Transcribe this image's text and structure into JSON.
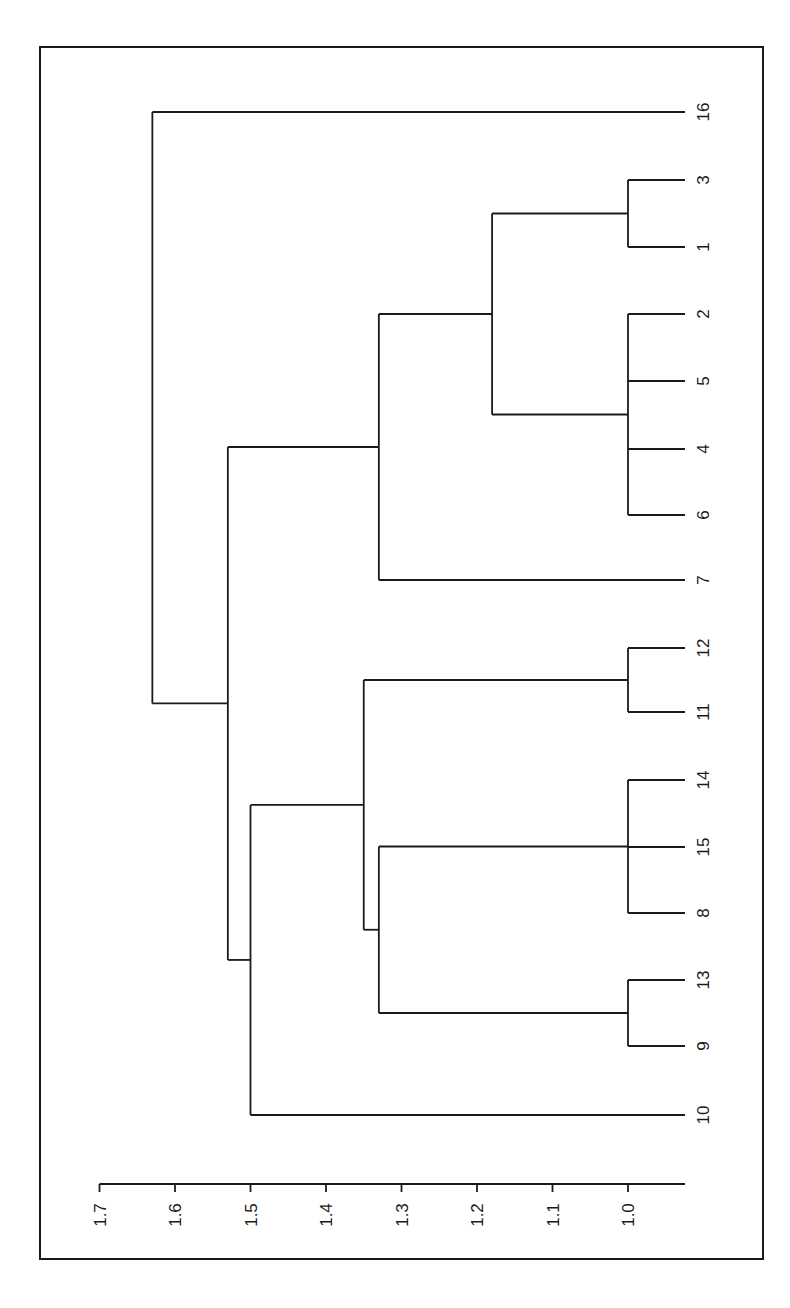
{
  "chart_data": {
    "type": "dendrogram",
    "orientation": "rotated-90 (leaves on right, height axis along bottom, labels rotated)",
    "title": "",
    "xlabel": "",
    "ylabel": "",
    "axis": {
      "range": [
        0.95,
        1.7
      ],
      "ticks": [
        1.7,
        1.6,
        1.5,
        1.4,
        1.3,
        1.2,
        1.1,
        1.0
      ],
      "tick_labels": [
        "1.7",
        "1.6",
        "1.5",
        "1.4",
        "1.3",
        "1.2",
        "1.1",
        "1.0"
      ]
    },
    "leaf_order": [
      "16",
      "3",
      "1",
      "2",
      "5",
      "4",
      "6",
      "7",
      "12",
      "11",
      "14",
      "15",
      "8",
      "13",
      "9",
      "10"
    ],
    "leaf_height": 0.93,
    "merges": [
      {
        "id": "m1",
        "members": [
          "3",
          "1"
        ],
        "height": 1.0
      },
      {
        "id": "m2",
        "members": [
          "2",
          "5",
          "4",
          "6"
        ],
        "height": 1.0
      },
      {
        "id": "m3",
        "members": [
          "12",
          "11"
        ],
        "height": 1.0
      },
      {
        "id": "m4",
        "members": [
          "14",
          "15",
          "8"
        ],
        "height": 1.0
      },
      {
        "id": "m5",
        "members": [
          "13",
          "9"
        ],
        "height": 1.0
      },
      {
        "id": "m6",
        "members": [
          "m1",
          "m2"
        ],
        "height": 1.18
      },
      {
        "id": "m7",
        "members": [
          "m6",
          "7"
        ],
        "height": 1.33
      },
      {
        "id": "m8",
        "members": [
          "m4",
          "m5"
        ],
        "height": 1.33
      },
      {
        "id": "m9",
        "members": [
          "m3",
          "m8"
        ],
        "height": 1.35
      },
      {
        "id": "m10",
        "members": [
          "m9",
          "10"
        ],
        "height": 1.5
      },
      {
        "id": "m11",
        "members": [
          "m7",
          "m10"
        ],
        "height": 1.53
      },
      {
        "id": "m12",
        "members": [
          "16",
          "m11"
        ],
        "height": 1.63
      }
    ],
    "grid": false,
    "legend": null
  },
  "layout": {
    "frame": {
      "x": 40,
      "y": 47,
      "w": 723,
      "h": 1212
    },
    "axis_y": 1184,
    "axis_x_end": 685,
    "tick_len": 8,
    "px_per_unit": 755,
    "x_at_1_0": 628,
    "leaf_tip_x": 685,
    "label_x": 703,
    "leaf_y": {
      "16": 112,
      "3": 180,
      "1": 247,
      "2": 314,
      "5": 381,
      "4": 449,
      "6": 515,
      "7": 580,
      "12": 648,
      "11": 712,
      "14": 780,
      "15": 847,
      "8": 913,
      "13": 980,
      "9": 1046,
      "10": 1115
    }
  }
}
